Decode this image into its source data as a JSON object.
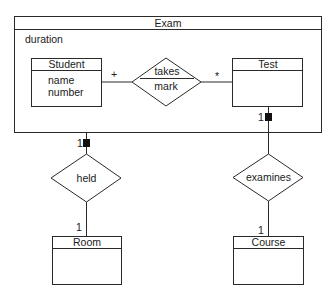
{
  "diagram": {
    "type": "uml-er-class-diagram",
    "container": {
      "name": "Exam",
      "attributes": [
        "duration"
      ]
    },
    "classes": [
      {
        "id": "student",
        "name": "Student",
        "attributes": [
          "name",
          "number"
        ]
      },
      {
        "id": "test",
        "name": "Test",
        "attributes": []
      },
      {
        "id": "room",
        "name": "Room",
        "attributes": []
      },
      {
        "id": "course",
        "name": "Course",
        "attributes": []
      }
    ],
    "relationships": [
      {
        "id": "takes",
        "name": "takes",
        "attribute": "mark",
        "from": "Student",
        "to": "Test",
        "from_multiplicity": "+",
        "to_multiplicity": "*"
      },
      {
        "id": "held",
        "name": "held",
        "from": "Exam",
        "to": "Room",
        "from_multiplicity": "1",
        "to_multiplicity": "1",
        "from_marker": "filled-square"
      },
      {
        "id": "examines",
        "name": "examines",
        "from": "Test",
        "to": "Course",
        "from_multiplicity": "1",
        "to_multiplicity": "1",
        "from_marker": "filled-square"
      }
    ]
  },
  "labels": {
    "exam_title": "Exam",
    "exam_attr_0": "duration",
    "student_title": "Student",
    "student_attr_0": "name",
    "student_attr_1": "number",
    "test_title": "Test",
    "room_title": "Room",
    "course_title": "Course",
    "takes_name": "takes",
    "takes_attr": "mark",
    "takes_mult_left": "+",
    "takes_mult_right": "*",
    "held_name": "held",
    "held_mult_top": "1",
    "held_mult_bottom": "1",
    "examines_name": "examines",
    "examines_mult_top": "1",
    "examines_mult_bottom": "1"
  }
}
